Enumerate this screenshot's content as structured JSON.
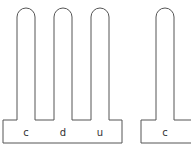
{
  "diagram": {
    "type": "place-value-blocks",
    "stroke_color": "#555555",
    "background": "#ffffff",
    "groups": [
      {
        "name": "left-group",
        "columns": [
          {
            "label": "c"
          },
          {
            "label": "d"
          },
          {
            "label": "u"
          }
        ]
      },
      {
        "name": "right-group",
        "columns": [
          {
            "label": "c"
          }
        ]
      }
    ]
  }
}
